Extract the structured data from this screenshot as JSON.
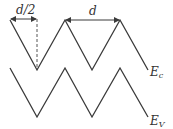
{
  "diagram": {
    "labels": {
      "half_period": "d/2",
      "period": "d",
      "conduction_band": "E",
      "conduction_band_sub": "c",
      "valence_band": "E",
      "valence_band_sub": "V"
    },
    "colors": {
      "line": "#3a3a3a",
      "background": "#ffffff"
    },
    "bands": [
      {
        "name": "Ec",
        "points": [
          [
            10,
            20
          ],
          [
            37,
            70
          ],
          [
            65,
            20
          ],
          [
            92,
            70
          ],
          [
            120,
            20
          ],
          [
            148,
            70
          ]
        ]
      },
      {
        "name": "Ev",
        "points": [
          [
            10,
            68
          ],
          [
            37,
            117
          ],
          [
            65,
            68
          ],
          [
            92,
            117
          ],
          [
            120,
            68
          ],
          [
            148,
            117
          ]
        ]
      }
    ]
  }
}
